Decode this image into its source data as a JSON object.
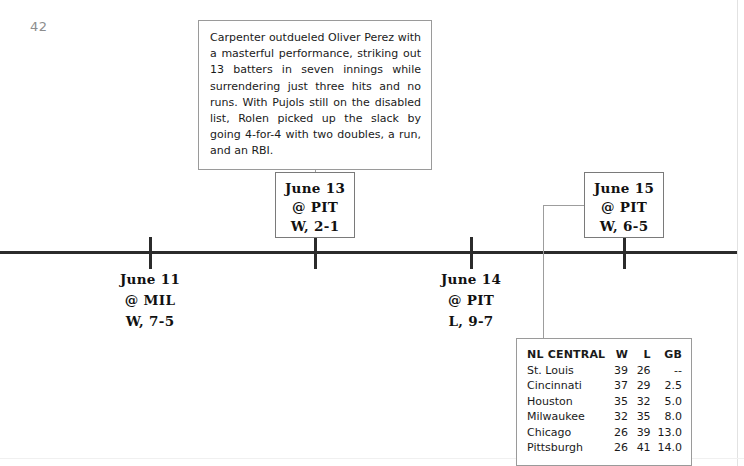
{
  "page": {
    "number": "42"
  },
  "callout": {
    "text": "Carpenter outdueled Oliver Perez with a masterful performance, striking out 13 batters in seven innings while surrendering just three hits and no runs. With Pujols still on the disabled list, Rolen picked up the slack by going 4-for-4 with two doubles, a run, and an RBI."
  },
  "timeline": {
    "games": [
      {
        "id": "june-11",
        "date": "June 11",
        "opponent": "@ MIL",
        "result": "W, 7-5",
        "position": "below",
        "tick_x": 150
      },
      {
        "id": "june-13",
        "date": "June 13",
        "opponent": "@ PIT",
        "result": "W, 2-1",
        "position": "above",
        "tick_x": 315
      },
      {
        "id": "june-14",
        "date": "June 14",
        "opponent": "@ PIT",
        "result": "L, 9-7",
        "position": "below",
        "tick_x": 471
      },
      {
        "id": "june-15",
        "date": "June 15",
        "opponent": "@ PIT",
        "result": "W, 6-5",
        "position": "above",
        "tick_x": 624
      }
    ]
  },
  "standings": {
    "headers": [
      "NL CENTRAL",
      "W",
      "L",
      "GB"
    ],
    "rows": [
      {
        "team": "St. Louis",
        "w": "39",
        "l": "26",
        "gb": "--"
      },
      {
        "team": "Cincinnati",
        "w": "37",
        "l": "29",
        "gb": "2.5"
      },
      {
        "team": "Houston",
        "w": "35",
        "l": "32",
        "gb": "5.0"
      },
      {
        "team": "Milwaukee",
        "w": "32",
        "l": "35",
        "gb": "8.0"
      },
      {
        "team": "Chicago",
        "w": "26",
        "l": "39",
        "gb": "13.0"
      },
      {
        "team": "Pittsburgh",
        "w": "26",
        "l": "41",
        "gb": "14.0"
      }
    ]
  },
  "colors": {
    "axis": "#2b2b2b",
    "box_border": "#7a7a7a",
    "callout_border": "#9a9a9a",
    "connector": "#9d9d9d",
    "page_number": "#8d8d8d",
    "text": "#1a1a1a"
  }
}
